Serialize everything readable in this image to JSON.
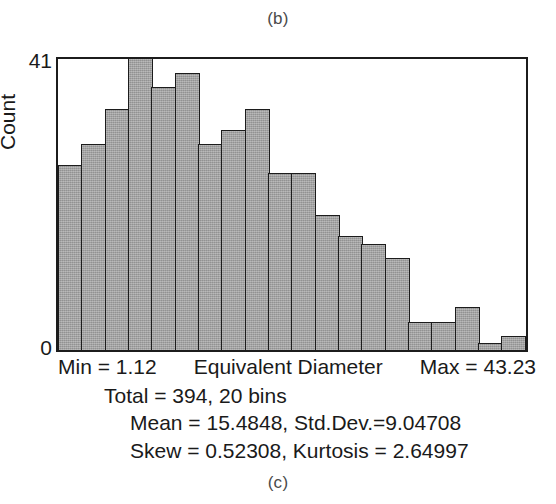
{
  "figure": {
    "panel_top_label": "(b)",
    "panel_bottom_label": "(c)"
  },
  "axes": {
    "y_label": "Count",
    "y_tick_top": "41",
    "y_tick_bottom": "0",
    "x_title": "Equivalent Diameter",
    "min_label": "Min = 1.12",
    "max_label": "Max = 43.23"
  },
  "stats": {
    "line1": "Total = 394, 20 bins",
    "line2": "Mean = 15.4848, Std.Dev.=9.04708",
    "line3": "Skew = 0.52308, Kurtosis = 2.64997"
  },
  "style": {
    "bar_fill": "#a3a3a3",
    "bar_stroke": "#1c1c1c",
    "frame_stroke": "#1c1c1c",
    "background": "#ffffff"
  },
  "chart_data": {
    "type": "bar",
    "title": "",
    "subtitle": "",
    "xlabel": "Equivalent Diameter",
    "ylabel": "Count",
    "ylim": [
      0,
      41
    ],
    "xlim": [
      1.12,
      43.23
    ],
    "grid": false,
    "legend": null,
    "bins": 20,
    "total": 394,
    "min": 1.12,
    "max": 43.23,
    "mean": 15.4848,
    "std_dev": 9.04708,
    "skew": 0.52308,
    "kurtosis": 2.64997,
    "categories": [
      "1.12-3.23",
      "3.23-5.33",
      "5.33-7.44",
      "7.44-9.54",
      "9.54-11.65",
      "11.65-13.76",
      "13.76-15.86",
      "15.86-17.97",
      "17.97-20.07",
      "20.07-22.18",
      "22.18-24.29",
      "24.29-26.39",
      "26.39-28.50",
      "28.50-30.60",
      "30.60-32.71",
      "32.71-34.82",
      "34.82-36.92",
      "36.92-39.03",
      "39.03-41.13",
      "41.13-43.23"
    ],
    "bin_centers": [
      2.17,
      4.28,
      6.38,
      8.49,
      10.6,
      12.7,
      14.81,
      16.91,
      19.02,
      21.13,
      23.23,
      25.34,
      27.44,
      29.55,
      31.66,
      33.76,
      35.87,
      37.97,
      40.08,
      42.18
    ],
    "values": [
      26,
      29,
      34,
      43,
      37,
      39,
      29,
      31,
      34,
      25,
      25,
      19,
      16,
      15,
      13,
      4,
      4,
      6,
      1,
      2
    ],
    "clipped_bars": [
      3
    ],
    "note": "Bar 4 exceeds the plotted y-axis maximum of 41 and is clipped at the frame top."
  }
}
